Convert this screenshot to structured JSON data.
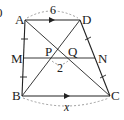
{
  "diagram": {
    "type": "trapezoid",
    "figure_number": "0",
    "points": {
      "A": {
        "label": "A",
        "x": 25,
        "y": 20
      },
      "D": {
        "label": "D",
        "x": 80,
        "y": 20
      },
      "B": {
        "label": "B",
        "x": 22,
        "y": 96
      },
      "C": {
        "label": "C",
        "x": 110,
        "y": 96
      },
      "M": {
        "label": "M",
        "x": 24,
        "y": 58
      },
      "N": {
        "label": "N",
        "x": 95,
        "y": 58
      },
      "P": {
        "label": "P",
        "x": 53,
        "y": 58
      },
      "Q": {
        "label": "Q",
        "x": 67,
        "y": 58
      }
    },
    "measures": {
      "AD": "6",
      "PQ": "2",
      "BC": "x"
    },
    "relations": [
      "AD ∥ BC",
      "AM = MB",
      "DN = NC"
    ]
  }
}
